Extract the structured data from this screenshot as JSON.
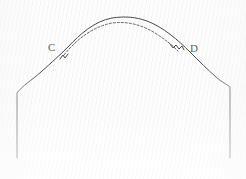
{
  "diagram": {
    "type": "sewing-pattern-sleeve-cap",
    "background_color": "#fdfdfd",
    "line_color": "#4a4a4a",
    "dashed_line_color": "#555555",
    "label_color": "#5e5e5e",
    "labels": [
      {
        "id": "c",
        "text": "C",
        "x": 48,
        "y": 42
      },
      {
        "id": "d",
        "text": "D",
        "x": 190,
        "y": 43
      }
    ],
    "notches": [
      {
        "id": "notch-c",
        "label": "C",
        "count": 1,
        "x": 62,
        "y": 57
      },
      {
        "id": "notch-d",
        "label": "D",
        "count": 2,
        "x": 176,
        "y": 50
      }
    ],
    "outline_path": "M 17 158 L 17 93 C 22 86 32 80 41 72 C 52 62 60 55 68 47 C 80 34 95 21 112 18 C 125 16 136 17 147 21 C 163 27 178 40 190 52 C 199 61 208 70 216 77 C 223 83 228 85 230 87 L 230 158",
    "dashed_path": "M 64 55 C 76 40 92 27 112 23 C 128 21 142 25 155 33 C 166 40 172 45 178 51",
    "notch_c_path": "M 60 59 L 63 55 L 65 58 L 68 54",
    "notch_d_path": "M 170 44 L 173 48 L 176 45 L 179 49 L 182 46 L 184 50"
  }
}
